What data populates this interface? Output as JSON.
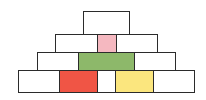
{
  "diagram": {
    "type": "brick-pyramid",
    "rows": [
      {
        "name": "row-1-top",
        "cells": [
          {
            "x": 83,
            "y": 11,
            "w": 47,
            "h": 24,
            "color": "#ffffff"
          }
        ]
      },
      {
        "name": "row-2",
        "cells": [
          {
            "x": 55,
            "y": 34,
            "w": 43,
            "h": 19,
            "color": "#ffffff"
          },
          {
            "x": 97,
            "y": 34,
            "w": 20,
            "h": 19,
            "color": "#f5b8c0"
          },
          {
            "x": 116,
            "y": 34,
            "w": 42,
            "h": 19,
            "color": "#ffffff"
          }
        ]
      },
      {
        "name": "row-3",
        "cells": [
          {
            "x": 37,
            "y": 52,
            "w": 42,
            "h": 19,
            "color": "#ffffff"
          },
          {
            "x": 78,
            "y": 52,
            "w": 57,
            "h": 19,
            "color": "#8db86a"
          },
          {
            "x": 134,
            "y": 52,
            "w": 42,
            "h": 19,
            "color": "#ffffff"
          }
        ]
      },
      {
        "name": "row-4-bottom",
        "cells": [
          {
            "x": 18,
            "y": 70,
            "w": 42,
            "h": 23,
            "color": "#ffffff"
          },
          {
            "x": 59,
            "y": 70,
            "w": 39,
            "h": 23,
            "color": "#f05545"
          },
          {
            "x": 97,
            "y": 70,
            "w": 19,
            "h": 23,
            "color": "#ffffff"
          },
          {
            "x": 115,
            "y": 70,
            "w": 39,
            "h": 23,
            "color": "#fbe67e"
          },
          {
            "x": 153,
            "y": 70,
            "w": 42,
            "h": 23,
            "color": "#ffffff"
          }
        ]
      }
    ],
    "colors": {
      "border": "#2b2b2b",
      "pink": "#f5b8c0",
      "green": "#8db86a",
      "red": "#f05545",
      "yellow": "#fbe67e",
      "empty": "#ffffff"
    }
  }
}
